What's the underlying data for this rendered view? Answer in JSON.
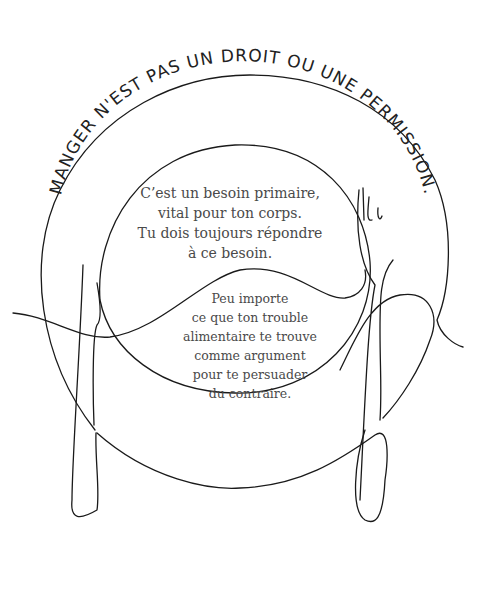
{
  "illustration": {
    "arc_title": "MANGER N'EST PAS UN DROIT OU UNE PERMISSION.",
    "message_primary": [
      "C’est un besoin primaire,",
      "vital pour ton corps.",
      "Tu dois toujours répondre",
      "à ce besoin."
    ],
    "message_secondary": [
      "Peu importe",
      "ce que ton trouble",
      "alimentaire te trouve",
      "comme argument",
      "pour te persuader",
      "du contraire."
    ],
    "colors": {
      "line": "#1a1a1a",
      "text": "#4a4a4a",
      "background": "#ffffff"
    }
  }
}
